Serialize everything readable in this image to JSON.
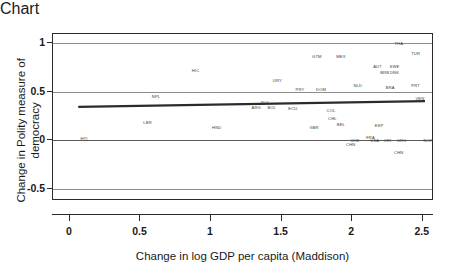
{
  "chart_data": {
    "type": "scatter",
    "title": "",
    "xlabel": "Change in log GDP per capita (Maddison)",
    "ylabel": "Change in Polity measure of democracy",
    "xlim": [
      -0.12,
      2.58
    ],
    "ylim": [
      -0.62,
      1.09
    ],
    "xticks": [
      "0",
      "0.5",
      "1",
      "1.5",
      "2",
      "2.5"
    ],
    "xtick_values": [
      0,
      0.5,
      1,
      1.5,
      2,
      2.5
    ],
    "yticks": [
      "1",
      "0.5",
      "0",
      "-0.5"
    ],
    "ytick_values": [
      1,
      0.5,
      0,
      -0.5
    ],
    "grid": "horizontal",
    "legend": "none",
    "point_style": "text-labels-only",
    "points": [
      {
        "label": "HTI",
        "x": 0.1,
        "y": 0.02
      },
      {
        "label": "LBR",
        "x": 0.55,
        "y": 0.19
      },
      {
        "label": "NPL",
        "x": 0.61,
        "y": 0.46
      },
      {
        "label": "HIC",
        "x": 0.89,
        "y": 0.72
      },
      {
        "label": "HND",
        "x": 1.04,
        "y": 0.14
      },
      {
        "label": "SLV",
        "x": 1.38,
        "y": 0.39
      },
      {
        "label": "ARG",
        "x": 1.32,
        "y": 0.34
      },
      {
        "label": "BOL",
        "x": 1.43,
        "y": 0.34
      },
      {
        "label": "URY",
        "x": 1.47,
        "y": 0.62
      },
      {
        "label": "PRY",
        "x": 1.63,
        "y": 0.53
      },
      {
        "label": "ECU",
        "x": 1.58,
        "y": 0.33
      },
      {
        "label": "GTM",
        "x": 1.75,
        "y": 0.86
      },
      {
        "label": "DOM",
        "x": 1.78,
        "y": 0.53
      },
      {
        "label": "MEX",
        "x": 1.92,
        "y": 0.86
      },
      {
        "label": "COL",
        "x": 1.85,
        "y": 0.31
      },
      {
        "label": "CHL",
        "x": 1.86,
        "y": 0.23
      },
      {
        "label": "GBR",
        "x": 1.73,
        "y": 0.14
      },
      {
        "label": "BEL",
        "x": 1.92,
        "y": 0.17
      },
      {
        "label": "NLD",
        "x": 2.04,
        "y": 0.57
      },
      {
        "label": "AUT",
        "x": 2.18,
        "y": 0.76
      },
      {
        "label": "SWE",
        "x": 2.3,
        "y": 0.76
      },
      {
        "label": "BRB",
        "x": 2.23,
        "y": 0.7
      },
      {
        "label": "DNK",
        "x": 2.3,
        "y": 0.7
      },
      {
        "label": "BRA",
        "x": 2.27,
        "y": 0.55
      },
      {
        "label": "ESP",
        "x": 2.19,
        "y": 0.16
      },
      {
        "label": "FRA",
        "x": 2.13,
        "y": 0.04
      },
      {
        "label": "CHE",
        "x": 2.02,
        "y": 0.0
      },
      {
        "label": "USA",
        "x": 2.16,
        "y": 0.0
      },
      {
        "label": "CRI",
        "x": 2.25,
        "y": 0.0
      },
      {
        "label": "GRC",
        "x": 2.35,
        "y": 0.0
      },
      {
        "label": "NOR",
        "x": 2.54,
        "y": 0.0
      },
      {
        "label": "CHN",
        "x": 1.99,
        "y": -0.04
      },
      {
        "label": "PRT",
        "x": 2.45,
        "y": 0.57
      },
      {
        "label": "VEN",
        "x": 2.48,
        "y": 0.43
      },
      {
        "label": "THA",
        "x": 2.33,
        "y": 1.0
      },
      {
        "label": "TUR",
        "x": 2.45,
        "y": 0.9
      },
      {
        "label": "CHN",
        "x": 2.33,
        "y": -0.12
      }
    ],
    "trendline": {
      "type": "linear-fit",
      "x_start": 0.06,
      "y_start": 0.335,
      "x_end": 2.53,
      "y_end": 0.395,
      "color": "#2b2b2b"
    },
    "colors": {
      "axis": "#2b2b2b",
      "grid": "#8c8c8c",
      "point_label": "#3a3a3a",
      "background": "#ffffff"
    }
  }
}
